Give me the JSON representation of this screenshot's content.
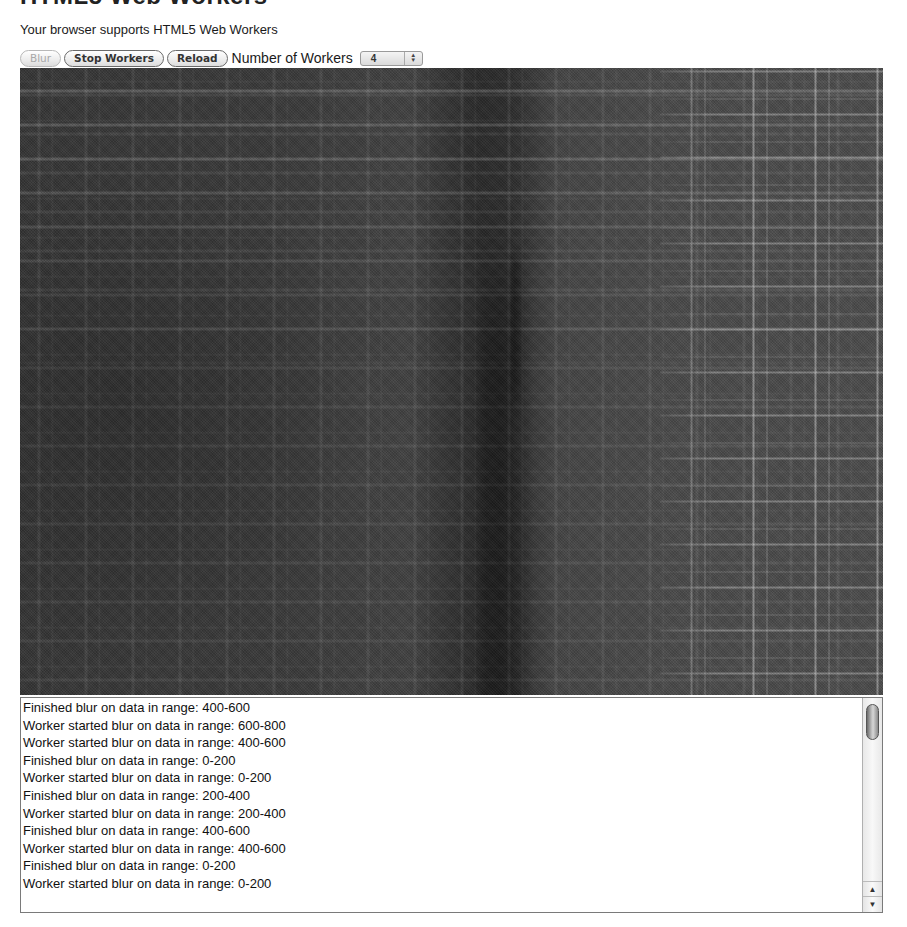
{
  "page": {
    "heading": "HTML5 Web Workers",
    "support_message": "Your browser supports HTML5 Web Workers"
  },
  "controls": {
    "blur_label": "Blur",
    "blur_disabled": true,
    "stop_workers_label": "Stop Workers",
    "reload_label": "Reload",
    "workers_label": "Number of Workers",
    "workers_selected": "4"
  },
  "canvas": {
    "description": "Grayscale image being blurred, plaid/grid texture"
  },
  "log": {
    "lines": [
      "Finished blur on data in range: 400-600",
      "Worker started blur on data in range: 600-800",
      "Worker started blur on data in range: 400-600",
      "Finished blur on data in range: 0-200",
      "Worker started blur on data in range: 0-200",
      "Finished blur on data in range: 200-400",
      "Worker started blur on data in range: 200-400",
      "Finished blur on data in range: 400-600",
      "Worker started blur on data in range: 400-600",
      "Finished blur on data in range: 0-200",
      "Worker started blur on data in range: 0-200"
    ],
    "scroll_up_icon": "▲",
    "scroll_down_icon": "▼"
  },
  "icons": {
    "select_up": "▲",
    "select_down": "▼"
  }
}
